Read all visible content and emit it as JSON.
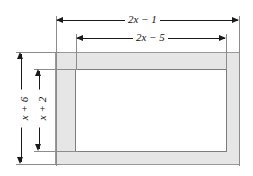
{
  "figure": {
    "background_color": "#ffffff",
    "outer_rect": {
      "name": "outer-border-rectangle",
      "fill_color": "#e6e6e6",
      "stroke_color": "#9a9a9a"
    },
    "inner_rect": {
      "name": "inner-rectangle",
      "fill_color": "#ffffff",
      "stroke_color": "#7d7d7d"
    }
  },
  "dimensions": {
    "outer_width_label": "2x − 1",
    "inner_width_label": "2x − 5",
    "outer_height_label": "x + 6",
    "inner_height_label": "x + 2"
  },
  "colors": {
    "dimension_line": "#1a1a1a",
    "extension_line": "#8c8c8c",
    "shaded_border": "#e6e6e6",
    "text": "#111111"
  }
}
